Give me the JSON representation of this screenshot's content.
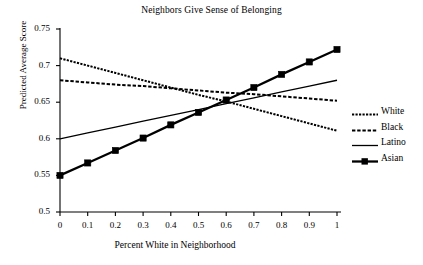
{
  "chart_data": {
    "type": "line",
    "title": "Neighbors Give Sense of Belonging",
    "xlabel": "Percent White in Neighborhood",
    "ylabel": "Predicted Average Score",
    "xlim": [
      0,
      1
    ],
    "ylim": [
      0.5,
      0.75
    ],
    "xticks": [
      "0",
      "0.1",
      "0.2",
      "0.3",
      "0.4",
      "0.5",
      "0.6",
      "0.7",
      "0.8",
      "0.9",
      "1"
    ],
    "yticks": [
      "0.5",
      "0.55",
      "0.6",
      "0.65",
      "0.7",
      "0.75"
    ],
    "xtick_values": [
      0,
      0.1,
      0.2,
      0.3,
      0.4,
      0.5,
      0.6,
      0.7,
      0.8,
      0.9,
      1
    ],
    "ytick_values": [
      0.5,
      0.55,
      0.6,
      0.65,
      0.7,
      0.75
    ],
    "grid": false,
    "legend_position": "right",
    "x": [
      0,
      0.1,
      0.2,
      0.3,
      0.4,
      0.5,
      0.6,
      0.7,
      0.8,
      0.9,
      1
    ],
    "series": [
      {
        "name": "White",
        "style": "fine-dashed",
        "markers": false,
        "values": [
          0.71,
          0.7,
          0.69,
          0.68,
          0.67,
          0.66,
          0.651,
          0.641,
          0.631,
          0.621,
          0.611
        ]
      },
      {
        "name": "Black",
        "style": "dashed",
        "markers": false,
        "values": [
          0.68,
          0.677,
          0.674,
          0.672,
          0.669,
          0.666,
          0.663,
          0.661,
          0.658,
          0.655,
          0.652
        ]
      },
      {
        "name": "Latino",
        "style": "solid-thin",
        "markers": false,
        "values": [
          0.6,
          0.608,
          0.616,
          0.624,
          0.632,
          0.64,
          0.648,
          0.656,
          0.664,
          0.672,
          0.68
        ]
      },
      {
        "name": "Asian",
        "style": "solid-thick",
        "markers": true,
        "values": [
          0.55,
          0.567,
          0.584,
          0.601,
          0.619,
          0.636,
          0.653,
          0.67,
          0.688,
          0.705,
          0.722
        ]
      }
    ]
  },
  "legend": {
    "items": [
      {
        "label": "White"
      },
      {
        "label": "Black"
      },
      {
        "label": "Latino"
      },
      {
        "label": "Asian"
      }
    ]
  },
  "colors": {
    "line": "#000000",
    "axis": "#000000",
    "background": "#ffffff"
  }
}
